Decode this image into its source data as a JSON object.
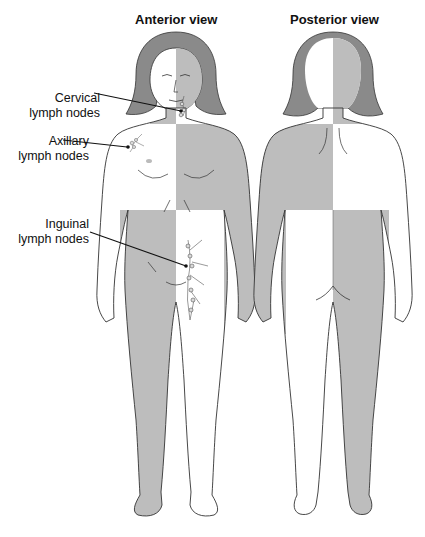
{
  "diagram": {
    "views": [
      {
        "id": "anterior",
        "title": "Anterior view"
      },
      {
        "id": "posterior",
        "title": "Posterior view"
      }
    ],
    "labels": [
      {
        "line1": "Cervical",
        "line2": "lymph nodes"
      },
      {
        "line1": "Axillary",
        "line2": "lymph nodes"
      },
      {
        "line1": "Inguinal",
        "line2": "lymph nodes"
      }
    ],
    "colors": {
      "shade": "#bdbdbd",
      "hair": "#8a8a8a",
      "outline": "#333333",
      "skin": "#ffffff",
      "leader": "#111111"
    }
  }
}
